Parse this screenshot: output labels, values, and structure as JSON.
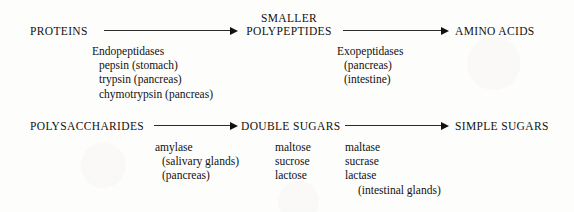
{
  "figure": {
    "background_color": "#fdfdfc",
    "text_color": "#111111",
    "arrow_color": "#2b2b2b"
  },
  "protein_pathway": {
    "start_label": "PROTEINS",
    "middle_label_line1": "SMALLER",
    "middle_label_line2": "POLYPEPTIDES",
    "end_label": "AMINO ACIDS",
    "left_enzymes": {
      "group_label": "Endopeptidases",
      "items": [
        "pepsin (stomach)",
        "trypsin (pancreas)",
        "chymotrypsin (pancreas)"
      ]
    },
    "right_enzymes": {
      "group_label": "Exopeptidases",
      "items": [
        "(pancreas)",
        "(intestine)"
      ]
    }
  },
  "carbohydrate_pathway": {
    "start_label": "POLYSACCHARIDES",
    "middle_label": "DOUBLE SUGARS",
    "end_label": "SIMPLE SUGARS",
    "left_enzymes": {
      "group_label": "amylase",
      "items": [
        "(salivary glands)",
        "(pancreas)"
      ]
    },
    "sugar_column": [
      "maltose",
      "sucrose",
      "lactose"
    ],
    "enzyme_column": {
      "items": [
        "maltase",
        "sucrase",
        "lactase"
      ],
      "source": "(intestinal glands)"
    }
  }
}
